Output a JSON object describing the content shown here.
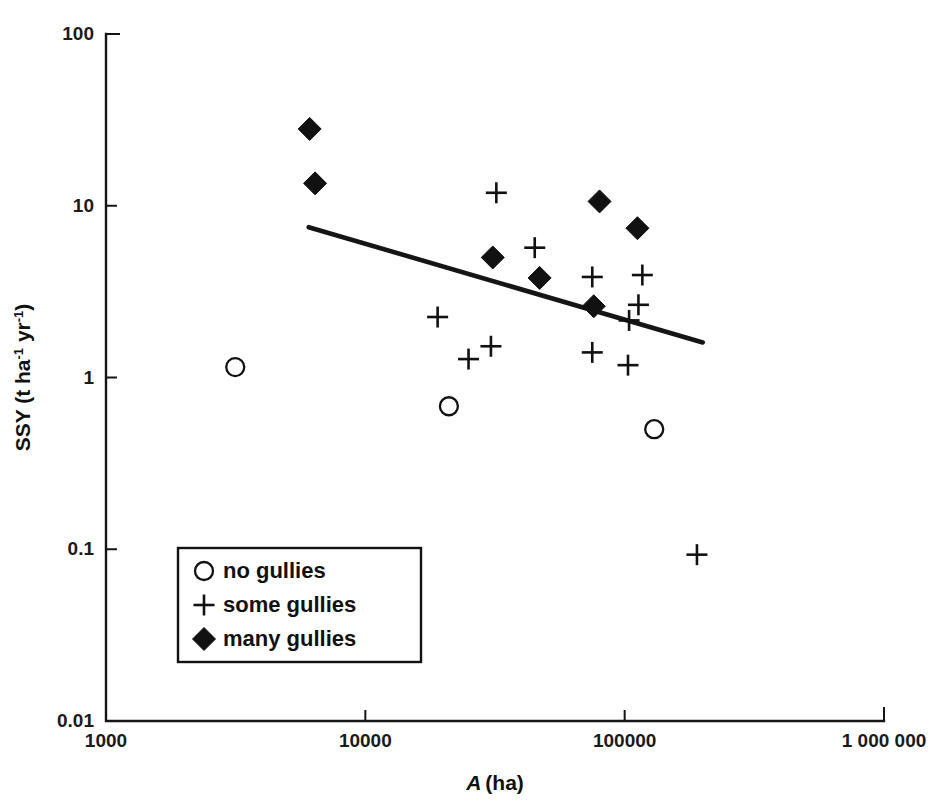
{
  "chart_data": {
    "type": "scatter",
    "title": "",
    "xlabel": "A (ha)",
    "ylabel": "SSY (t ha-1 yr-1)",
    "xlabel_parts": {
      "italic": "A",
      "rest": "(ha)"
    },
    "ylabel_parts": {
      "main": "SSY (t ha",
      "sup1": "-1",
      "mid": " yr",
      "sup2": "-1",
      "tail": ")"
    },
    "xscale": "log",
    "yscale": "log",
    "xlim": [
      1000,
      1000000
    ],
    "ylim": [
      0.01,
      100
    ],
    "grid": false,
    "xticks": [
      1000,
      10000,
      100000,
      1000000
    ],
    "xtick_labels": [
      "1000",
      "10000",
      "100000",
      "1 000 000"
    ],
    "yticks": [
      0.01,
      0.1,
      1,
      10,
      100
    ],
    "ytick_labels": [
      "0.01",
      "0.1",
      "1",
      "10",
      "100"
    ],
    "legend_position": "lower-left-inside",
    "series": [
      {
        "name": "no gullies",
        "marker": "open-circle",
        "color": "#111111",
        "points": [
          {
            "x": 3150,
            "y": 1.15
          },
          {
            "x": 21000,
            "y": 0.68
          },
          {
            "x": 130000,
            "y": 0.5
          }
        ]
      },
      {
        "name": "some gullies",
        "marker": "plus",
        "color": "#111111",
        "points": [
          {
            "x": 19000,
            "y": 2.25
          },
          {
            "x": 25000,
            "y": 1.28
          },
          {
            "x": 32000,
            "y": 11.9
          },
          {
            "x": 30500,
            "y": 1.52
          },
          {
            "x": 45000,
            "y": 5.7
          },
          {
            "x": 75000,
            "y": 3.85
          },
          {
            "x": 75000,
            "y": 1.4
          },
          {
            "x": 104000,
            "y": 2.15
          },
          {
            "x": 113000,
            "y": 2.65
          },
          {
            "x": 117000,
            "y": 3.95
          },
          {
            "x": 103000,
            "y": 1.18
          },
          {
            "x": 190000,
            "y": 0.093
          }
        ]
      },
      {
        "name": "many gullies",
        "marker": "filled-diamond",
        "color": "#111111",
        "points": [
          {
            "x": 6100,
            "y": 28.0
          },
          {
            "x": 6400,
            "y": 13.5
          },
          {
            "x": 31000,
            "y": 5.0
          },
          {
            "x": 47000,
            "y": 3.8
          },
          {
            "x": 80000,
            "y": 10.6
          },
          {
            "x": 76000,
            "y": 2.6
          },
          {
            "x": 112000,
            "y": 7.4
          }
        ]
      }
    ],
    "trend_line": {
      "name": "regression-line",
      "start": {
        "x": 6050,
        "y": 7.5
      },
      "end": {
        "x": 200000,
        "y": 1.6
      }
    },
    "legend": {
      "entries": [
        {
          "label": "no gullies",
          "marker": "open-circle"
        },
        {
          "label": "some gullies",
          "marker": "plus"
        },
        {
          "label": "many gullies",
          "marker": "filled-diamond"
        }
      ]
    }
  }
}
